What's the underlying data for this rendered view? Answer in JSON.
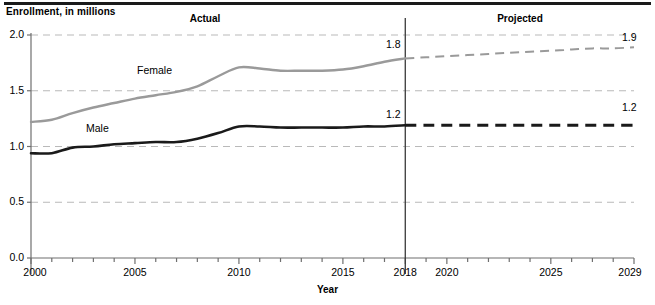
{
  "chart_data": {
    "type": "line",
    "title": "",
    "ylabel": "Enrollment, in millions",
    "xlabel": "Year",
    "xlim": [
      2000,
      2029
    ],
    "ylim": [
      0.0,
      2.0
    ],
    "grid": true,
    "legend": "inline-series-labels",
    "y_ticks": [
      "0.0",
      "0.5",
      "1.0",
      "1.5",
      "2.0"
    ],
    "y_tick_values": [
      0.0,
      0.5,
      1.0,
      1.5,
      2.0
    ],
    "x_ticks": [
      "2000",
      "2005",
      "2010",
      "2015",
      "2018",
      "2020",
      "2025",
      "2029"
    ],
    "x_tick_values": [
      2000,
      2005,
      2010,
      2015,
      2018,
      2020,
      2025,
      2029
    ],
    "period_divider_year": 2018,
    "annotations": {
      "actual": "Actual",
      "projected": "Projected",
      "female_at_divider": "1.8",
      "male_at_divider": "1.2",
      "female_at_end": "1.9",
      "male_at_end": "1.2"
    },
    "series": [
      {
        "name": "Female",
        "color": "#9a9a9a",
        "actual": {
          "x": [
            2000,
            2001,
            2002,
            2003,
            2004,
            2005,
            2006,
            2007,
            2008,
            2009,
            2010,
            2011,
            2012,
            2013,
            2014,
            2015,
            2016,
            2017,
            2018
          ],
          "values": [
            1.22,
            1.24,
            1.3,
            1.35,
            1.39,
            1.43,
            1.46,
            1.49,
            1.54,
            1.63,
            1.71,
            1.7,
            1.68,
            1.68,
            1.68,
            1.69,
            1.72,
            1.76,
            1.79
          ]
        },
        "projected": {
          "x": [
            2018,
            2019,
            2020,
            2021,
            2022,
            2023,
            2024,
            2025,
            2026,
            2027,
            2028,
            2029
          ],
          "values": [
            1.79,
            1.8,
            1.81,
            1.82,
            1.83,
            1.84,
            1.85,
            1.86,
            1.87,
            1.88,
            1.88,
            1.89
          ]
        }
      },
      {
        "name": "Male",
        "color": "#1a1a1a",
        "actual": {
          "x": [
            2000,
            2001,
            2002,
            2003,
            2004,
            2005,
            2006,
            2007,
            2008,
            2009,
            2010,
            2011,
            2012,
            2013,
            2014,
            2015,
            2016,
            2017,
            2018
          ],
          "values": [
            0.94,
            0.94,
            0.99,
            1.0,
            1.02,
            1.03,
            1.04,
            1.04,
            1.07,
            1.12,
            1.18,
            1.18,
            1.17,
            1.17,
            1.17,
            1.17,
            1.18,
            1.18,
            1.19
          ]
        },
        "projected": {
          "x": [
            2018,
            2019,
            2020,
            2021,
            2022,
            2023,
            2024,
            2025,
            2026,
            2027,
            2028,
            2029
          ],
          "values": [
            1.19,
            1.19,
            1.19,
            1.19,
            1.19,
            1.19,
            1.19,
            1.19,
            1.19,
            1.19,
            1.19,
            1.19
          ]
        }
      }
    ]
  },
  "colors": {
    "female": "#9a9a9a",
    "male": "#1a1a1a",
    "grid": "#b9b9b9",
    "axis": "#6f6f6f",
    "rule": "#1a1a1a"
  }
}
